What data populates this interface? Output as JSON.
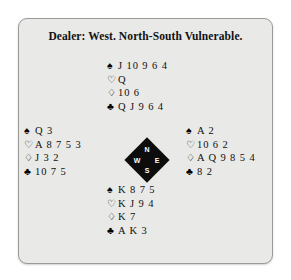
{
  "panel": {
    "title": "Dealer: West. North-South Vulnerable.",
    "background_color": "#e9e9e7",
    "border_color": "#9a9a9a"
  },
  "suit_symbols": {
    "spade": "♠",
    "heart": "♡",
    "diamond": "♢",
    "club": "♣"
  },
  "compass": {
    "north": "N",
    "west": "W",
    "east": "E",
    "south": "S",
    "color": "#0d0d0d",
    "label_color": "#ffffff"
  },
  "hands": {
    "north": {
      "position": "North",
      "spades": "J 10 9 6 4",
      "hearts": "Q",
      "diamonds": "10 6",
      "clubs": "Q J 9 6 4"
    },
    "west": {
      "position": "West",
      "spades": "Q 3",
      "hearts": "A 8 7 5 3",
      "diamonds": "J 3 2",
      "clubs": "10 7 5"
    },
    "east": {
      "position": "East",
      "spades": "A 2",
      "hearts": "10 6 2",
      "diamonds": "A Q 9 8 5 4",
      "clubs": "8 2"
    },
    "south": {
      "position": "South",
      "spades": "K 8 7 5",
      "hearts": "K J 9 4",
      "diamonds": "K 7",
      "clubs": "A K 3"
    }
  }
}
